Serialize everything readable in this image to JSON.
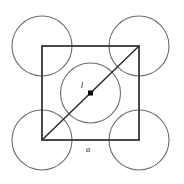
{
  "figure": {
    "background_color": "#ffffff",
    "canvas": {
      "width": 184,
      "height": 184
    },
    "labels": {
      "diagonal_label": "l",
      "side_label": "a"
    },
    "colors": {
      "square_stroke": "#2b2b2b",
      "circle_stroke": "#6e6e6e",
      "diagonal_stroke": "#2b2b2b",
      "centre_dot_fill": "#000000",
      "label_fill": "#1a1a1a"
    },
    "geometry": {
      "square": {
        "x": 42,
        "y": 46,
        "width": 97,
        "height": 94,
        "stroke_width": 1.6
      },
      "corner_circles": [
        {
          "name": "top-left-circle",
          "cx": 42,
          "cy": 46,
          "r": 30
        },
        {
          "name": "top-right-circle",
          "cx": 139,
          "cy": 46,
          "r": 30
        },
        {
          "name": "bottom-left-circle",
          "cx": 42,
          "cy": 140,
          "r": 30
        },
        {
          "name": "bottom-right-circle",
          "cx": 139,
          "cy": 140,
          "r": 30
        }
      ],
      "centre_circle": {
        "name": "centre-circle",
        "cx": 90.5,
        "cy": 93,
        "r": 30
      },
      "diagonal": {
        "x1": 42,
        "y1": 140,
        "x2": 139,
        "y2": 46,
        "stroke_width": 1.5
      },
      "centre_dot": {
        "cx": 90.5,
        "cy": 93,
        "size": 5
      },
      "label_positions": {
        "diagonal_label": {
          "x": 82,
          "y": 88
        },
        "side_label": {
          "x": 88,
          "y": 151
        }
      }
    }
  }
}
